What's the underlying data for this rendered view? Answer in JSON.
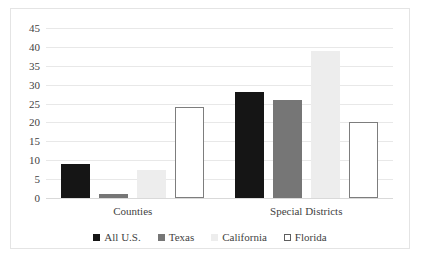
{
  "chart_data": {
    "type": "bar",
    "title": "",
    "xlabel": "",
    "ylabel": "",
    "categories": [
      "Counties",
      "Special Districts"
    ],
    "series": [
      {
        "name": "All U.S.",
        "color": "#151515",
        "values": [
          9,
          28
        ]
      },
      {
        "name": "Texas",
        "color": "#767676",
        "values": [
          1,
          26
        ]
      },
      {
        "name": "California",
        "color": "#ededed",
        "values": [
          7.5,
          39
        ]
      },
      {
        "name": "Florida",
        "color": "#ffffff",
        "values": [
          24,
          20
        ]
      }
    ],
    "ylim": [
      0,
      45
    ],
    "ytick_labels": [
      "45",
      "40",
      "35",
      "30",
      "25",
      "20",
      "15",
      "10",
      "5",
      "0"
    ],
    "ytick_values": [
      45,
      40,
      35,
      30,
      25,
      20,
      15,
      10,
      5,
      0
    ],
    "grid": true,
    "legend_position": "bottom"
  },
  "legend": {
    "items": [
      {
        "label": "All U.S."
      },
      {
        "label": "Texas"
      },
      {
        "label": "California"
      },
      {
        "label": "Florida"
      }
    ]
  },
  "axis": {
    "labels": [
      "Counties",
      "Special Districts"
    ]
  }
}
